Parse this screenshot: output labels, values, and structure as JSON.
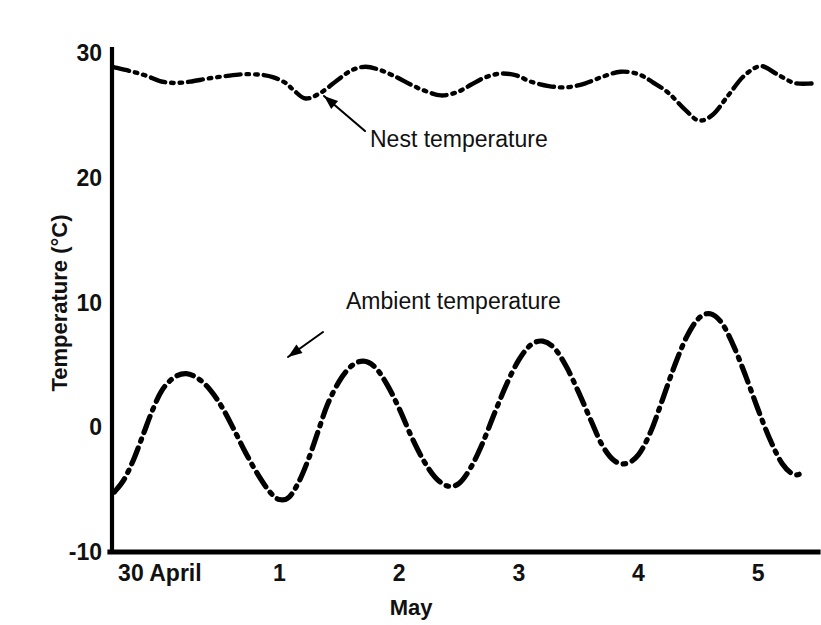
{
  "chart_data": {
    "type": "line",
    "title": "",
    "xlabel": "May",
    "ylabel": "Temperature (°C)",
    "ylim": [
      -10,
      30
    ],
    "xlim": [
      29.6,
      5.5
    ],
    "grid": false,
    "legend_position": "inline-annotations",
    "ytick_labels": [
      "30",
      "20",
      "10",
      "0",
      "-10"
    ],
    "ytick_values": [
      30,
      20,
      10,
      0,
      -10
    ],
    "xtick_labels": [
      "30 April",
      "1",
      "2",
      "3",
      "4",
      "5"
    ],
    "xtick_values": [
      30.0,
      1.0,
      2.0,
      3.0,
      4.0,
      5.0
    ],
    "series": [
      {
        "name": "Nest temperature",
        "style": "dash-dot-dot",
        "color": "#000000",
        "x": [
          29.62,
          29.75,
          29.88,
          30.0,
          30.12,
          30.25,
          30.4,
          30.55,
          30.7,
          30.85,
          0.95,
          1.05,
          1.12,
          1.22,
          1.35,
          1.48,
          1.6,
          1.72,
          1.85,
          1.98,
          2.1,
          2.22,
          2.35,
          2.48,
          2.6,
          2.72,
          2.85,
          2.98,
          3.1,
          3.25,
          3.4,
          3.55,
          3.7,
          3.85,
          4.0,
          4.12,
          4.25,
          4.38,
          4.5,
          4.62,
          4.75,
          4.88,
          5.02,
          5.15,
          5.3,
          5.45
        ],
        "y": [
          28.85,
          28.55,
          28.2,
          27.75,
          27.6,
          27.7,
          27.95,
          28.15,
          28.3,
          28.25,
          28.05,
          27.6,
          27.0,
          26.35,
          26.85,
          27.8,
          28.6,
          28.9,
          28.6,
          28.05,
          27.45,
          26.95,
          26.6,
          26.85,
          27.45,
          28.05,
          28.35,
          28.2,
          27.7,
          27.35,
          27.25,
          27.55,
          28.1,
          28.5,
          28.3,
          27.65,
          26.8,
          25.55,
          24.6,
          25.05,
          26.6,
          28.15,
          28.95,
          28.35,
          27.6,
          27.55
        ],
        "min": 24.6,
        "max": 28.95,
        "line_width": 4.4
      },
      {
        "name": "Ambient temperature",
        "style": "dash-dot",
        "color": "#000000",
        "x": [
          29.62,
          29.7,
          29.78,
          29.86,
          29.94,
          30.02,
          30.12,
          30.22,
          30.32,
          30.42,
          30.52,
          30.62,
          30.72,
          30.82,
          30.92,
          1.0,
          1.08,
          1.16,
          1.24,
          1.32,
          1.4,
          1.5,
          1.6,
          1.7,
          1.8,
          1.9,
          2.0,
          2.1,
          2.2,
          2.3,
          2.4,
          2.5,
          2.6,
          2.7,
          2.8,
          2.9,
          3.0,
          3.1,
          3.2,
          3.3,
          3.4,
          3.5,
          3.6,
          3.7,
          3.8,
          3.9,
          4.0,
          4.1,
          4.2,
          4.3,
          4.4,
          4.5,
          4.6,
          4.7,
          4.8,
          4.9,
          5.0,
          5.1,
          5.2,
          5.3,
          5.38
        ],
        "y": [
          -5.2,
          -4.2,
          -2.6,
          -0.6,
          1.4,
          3.0,
          4.0,
          4.3,
          3.9,
          3.0,
          1.6,
          -0.2,
          -2.1,
          -3.8,
          -5.2,
          -5.8,
          -5.6,
          -4.4,
          -2.6,
          -0.4,
          1.8,
          3.7,
          4.9,
          5.3,
          4.8,
          3.4,
          1.5,
          -0.7,
          -2.6,
          -4.0,
          -4.7,
          -4.5,
          -3.2,
          -1.2,
          1.2,
          3.5,
          5.4,
          6.6,
          6.9,
          6.3,
          4.8,
          2.8,
          0.6,
          -1.5,
          -2.7,
          -2.9,
          -2.2,
          -0.4,
          2.2,
          4.9,
          7.2,
          8.7,
          9.1,
          8.3,
          6.4,
          4.0,
          1.4,
          -1.0,
          -2.9,
          -3.8,
          -3.6
        ],
        "min": -6.0,
        "max": 12.4,
        "line_width": 5.2
      }
    ],
    "annotations": [
      {
        "name": "nest-temperature-annotation",
        "label": "Nest temperature",
        "text_x": 370,
        "text_y": 128,
        "arrow_from_x": 365,
        "arrow_from_y": 131,
        "arrow_to_x": 324,
        "arrow_to_y": 96
      },
      {
        "name": "ambient-temperature-annotation",
        "label": "Ambient temperature",
        "text_x": 346,
        "text_y": 290,
        "arrow_from_x": 323,
        "arrow_from_y": 332,
        "arrow_to_x": 288,
        "arrow_to_y": 357
      }
    ]
  },
  "axes": {
    "y_axis_name": "y-axis",
    "x_axis_name": "x-axis"
  }
}
